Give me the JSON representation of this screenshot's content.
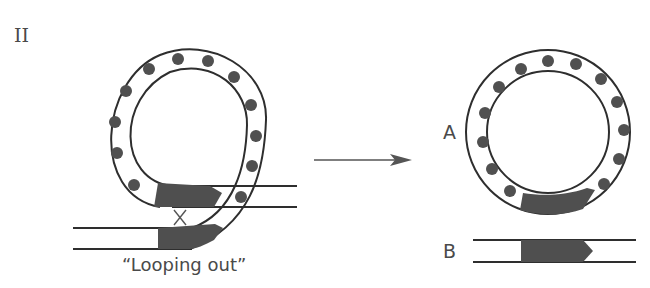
{
  "panel_label": "II",
  "left": {
    "caption": "“Looping out”",
    "crossover_mark": "X"
  },
  "right": {
    "label_a": "A",
    "label_b": "B"
  },
  "colors": {
    "stroke": "#2e2e2e",
    "dot": "#505050",
    "gene": "#4f4f4f",
    "text": "#4a4a4a"
  }
}
